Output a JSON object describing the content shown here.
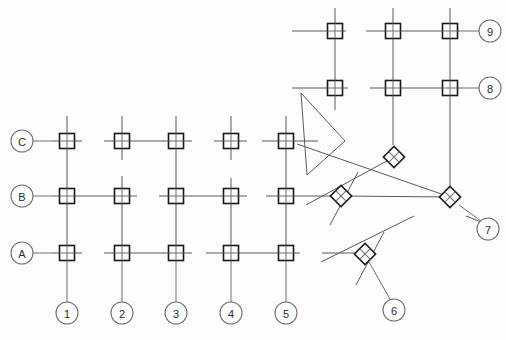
{
  "drawing": {
    "title": "Structural Column Grid Plan",
    "type": "cad-grid-plan",
    "canvas": {
      "width": 506,
      "height": 340
    },
    "colors": {
      "background": "#fdfdfd",
      "gridline": "#5a5a5a",
      "column_outline": "#1a1a1a",
      "column_fill": "#ffffff",
      "bubble_stroke": "#707070",
      "bubble_text": "#2b2b2b"
    },
    "bubble_radius": 11,
    "column_size": 15,
    "diamond_size": 15
  },
  "row_grids": [
    {
      "label": "C",
      "bubble": {
        "cx": 22,
        "cy": 141
      },
      "leader": {
        "x1": 33,
        "y1": 141,
        "x2": 52,
        "y2": 141
      },
      "line": {
        "x1": 52,
        "y1": 141,
        "x2": 318,
        "y2": 141
      },
      "breaks": [
        [
          82,
          104
        ],
        [
          192,
          214
        ],
        [
          247,
          262
        ]
      ]
    },
    {
      "label": "B",
      "bubble": {
        "cx": 22,
        "cy": 196
      },
      "leader": {
        "x1": 33,
        "y1": 196,
        "x2": 52,
        "y2": 196
      },
      "line": {
        "x1": 52,
        "y1": 196,
        "x2": 336,
        "y2": 196
      },
      "breaks": [
        [
          137,
          159
        ],
        [
          247,
          266
        ]
      ]
    },
    {
      "label": "A",
      "bubble": {
        "cx": 22,
        "cy": 253
      },
      "leader": {
        "x1": 33,
        "y1": 253,
        "x2": 52,
        "y2": 253
      },
      "line": {
        "x1": 52,
        "y1": 253,
        "x2": 364,
        "y2": 253
      },
      "breaks": [
        [
          82,
          104
        ],
        [
          192,
          206
        ],
        [
          300,
          322
        ]
      ]
    }
  ],
  "column_grids": [
    {
      "label": "1",
      "bubble": {
        "cx": 67,
        "cy": 313
      },
      "leader": {
        "x1": 67,
        "y1": 302,
        "x2": 67,
        "y2": 261
      },
      "line": {
        "x1": 67,
        "y1": 116,
        "x2": 67,
        "y2": 261
      },
      "breaks": []
    },
    {
      "label": "2",
      "bubble": {
        "cx": 122,
        "cy": 313
      },
      "leader": {
        "x1": 122,
        "y1": 302,
        "x2": 122,
        "y2": 261
      },
      "line": {
        "x1": 122,
        "y1": 116,
        "x2": 122,
        "y2": 261
      },
      "breaks": [
        [
          160,
          176
        ]
      ]
    },
    {
      "label": "3",
      "bubble": {
        "cx": 176,
        "cy": 313
      },
      "leader": {
        "x1": 176,
        "y1": 302,
        "x2": 176,
        "y2": 261
      },
      "line": {
        "x1": 176,
        "y1": 116,
        "x2": 176,
        "y2": 261
      },
      "breaks": []
    },
    {
      "label": "4",
      "bubble": {
        "cx": 231,
        "cy": 313
      },
      "leader": {
        "x1": 231,
        "y1": 302,
        "x2": 231,
        "y2": 261
      },
      "line": {
        "x1": 231,
        "y1": 116,
        "x2": 231,
        "y2": 261
      },
      "breaks": [
        [
          160,
          178
        ]
      ]
    },
    {
      "label": "5",
      "bubble": {
        "cx": 286,
        "cy": 313
      },
      "leader": {
        "x1": 286,
        "y1": 302,
        "x2": 286,
        "y2": 261
      },
      "line": {
        "x1": 286,
        "y1": 116,
        "x2": 286,
        "y2": 261
      },
      "breaks": []
    }
  ],
  "rotated_row_grids": [
    {
      "label": "9",
      "bubble": {
        "cx": 490,
        "cy": 31
      },
      "leader": {
        "x1": 479,
        "y1": 31,
        "x2": 459,
        "y2": 31
      },
      "line": {
        "x1": 292,
        "y1": 31,
        "x2": 459,
        "y2": 31
      },
      "breaks": [
        [
          346,
          366
        ]
      ]
    },
    {
      "label": "8",
      "bubble": {
        "cx": 490,
        "cy": 88
      },
      "leader": {
        "x1": 479,
        "y1": 88,
        "x2": 459,
        "y2": 88
      },
      "line": {
        "x1": 292,
        "y1": 88,
        "x2": 459,
        "y2": 88
      },
      "breaks": [
        [
          348,
          370
        ]
      ]
    },
    {
      "label": "7",
      "bubble": {
        "cx": 488,
        "cy": 229
      },
      "leader": {
        "x1": 481,
        "y1": 221,
        "x2": 459,
        "y2": 205
      },
      "line": null,
      "breaks": []
    },
    {
      "label": "6",
      "bubble": {
        "cx": 394,
        "cy": 310
      },
      "leader": {
        "x1": 390,
        "y1": 299,
        "x2": 369,
        "y2": 262
      },
      "line": null,
      "breaks": []
    }
  ],
  "rotated_column_grids": [
    {
      "id": "rot-col-left",
      "line": {
        "x1": 335,
        "y1": 8,
        "x2": 335,
        "y2": 110
      }
    },
    {
      "id": "rot-col-mid",
      "line": {
        "x1": 393,
        "y1": 8,
        "x2": 393,
        "y2": 145
      }
    },
    {
      "id": "rot-col-right",
      "line": {
        "x1": 450,
        "y1": 8,
        "x2": 450,
        "y2": 186
      }
    }
  ],
  "diagonal_gridlines": [
    {
      "id": "diag-a",
      "x1": 297,
      "y1": 144,
      "x2": 450,
      "y2": 197
    },
    {
      "id": "diag-b",
      "x1": 306,
      "y1": 205,
      "x2": 394,
      "y2": 157
    },
    {
      "id": "diag-c",
      "x1": 321,
      "y1": 262,
      "x2": 414,
      "y2": 216
    },
    {
      "id": "diag-d",
      "x1": 341,
      "y1": 196,
      "x2": 450,
      "y2": 197
    },
    {
      "id": "diag-e",
      "x1": 358,
      "y1": 172,
      "x2": 330,
      "y2": 225
    },
    {
      "id": "diag-f",
      "x1": 384,
      "y1": 232,
      "x2": 356,
      "y2": 285
    },
    {
      "id": "diag-g",
      "x1": 466,
      "y1": 216,
      "x2": 481,
      "y2": 222
    }
  ],
  "square_columns": [
    {
      "id": "C1",
      "cx": 67,
      "cy": 141
    },
    {
      "id": "C2",
      "cx": 122,
      "cy": 141
    },
    {
      "id": "C3",
      "cx": 176,
      "cy": 141
    },
    {
      "id": "C4",
      "cx": 231,
      "cy": 141
    },
    {
      "id": "C5",
      "cx": 286,
      "cy": 141
    },
    {
      "id": "B1",
      "cx": 67,
      "cy": 196
    },
    {
      "id": "B2",
      "cx": 122,
      "cy": 196
    },
    {
      "id": "B3",
      "cx": 176,
      "cy": 196
    },
    {
      "id": "B4",
      "cx": 231,
      "cy": 196
    },
    {
      "id": "B5",
      "cx": 286,
      "cy": 196
    },
    {
      "id": "A1",
      "cx": 67,
      "cy": 253
    },
    {
      "id": "A2",
      "cx": 122,
      "cy": 253
    },
    {
      "id": "A3",
      "cx": 176,
      "cy": 253
    },
    {
      "id": "A4",
      "cx": 231,
      "cy": 253
    },
    {
      "id": "A5",
      "cx": 286,
      "cy": 253
    },
    {
      "id": "R9a",
      "cx": 335,
      "cy": 31
    },
    {
      "id": "R9b",
      "cx": 393,
      "cy": 31
    },
    {
      "id": "R9c",
      "cx": 450,
      "cy": 31
    },
    {
      "id": "R8a",
      "cx": 335,
      "cy": 88
    },
    {
      "id": "R8b",
      "cx": 393,
      "cy": 88
    },
    {
      "id": "R8c",
      "cx": 450,
      "cy": 88
    }
  ],
  "diamond_columns": [
    {
      "id": "D1",
      "cx": 394,
      "cy": 157,
      "rotation": 45
    },
    {
      "id": "D2",
      "cx": 341,
      "cy": 196,
      "rotation": 45
    },
    {
      "id": "D3",
      "cx": 450,
      "cy": 197,
      "rotation": 45
    },
    {
      "id": "D4",
      "cx": 365,
      "cy": 254,
      "rotation": 45
    }
  ],
  "triangle_marker": {
    "id": "transition-triangle",
    "points": "301,93 345,141 307,175"
  }
}
